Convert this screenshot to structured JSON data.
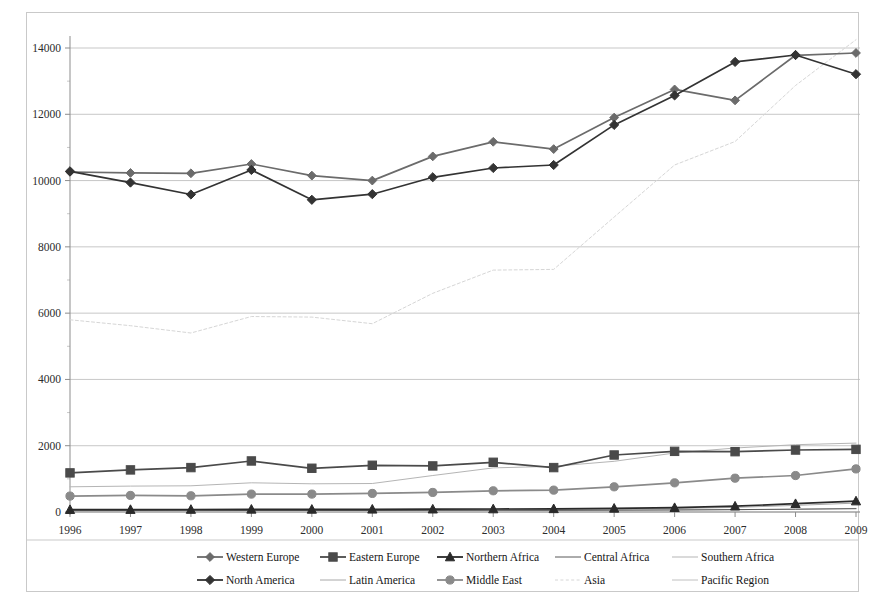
{
  "chart_data": {
    "type": "line",
    "title": "",
    "subtitle": "",
    "xlabel": "",
    "ylabel": "",
    "categories": [
      "1996",
      "1997",
      "1998",
      "1999",
      "2000",
      "2001",
      "2002",
      "2003",
      "2004",
      "2005",
      "2006",
      "2007",
      "2008",
      "2009"
    ],
    "x": [
      1996,
      1997,
      1998,
      1999,
      2000,
      2001,
      2002,
      2003,
      2004,
      2005,
      2006,
      2007,
      2008,
      2009
    ],
    "ylim": [
      0,
      14000
    ],
    "yticks": [
      0,
      2000,
      4000,
      6000,
      8000,
      10000,
      12000,
      14000
    ],
    "ytick_labels": [
      "0",
      "2000",
      "4000",
      "6000",
      "8000",
      "10000",
      "12000",
      "14000"
    ],
    "grid": true,
    "legend_position": "bottom",
    "legend_columns": 5,
    "series": [
      {
        "name": "Western Europe",
        "marker": "diamond",
        "color": "#6b6b6b",
        "values": [
          10260,
          10230,
          10220,
          10500,
          10150,
          10000,
          10730,
          11170,
          10950,
          11900,
          12750,
          12420,
          13780,
          13850
        ]
      },
      {
        "name": "Eastern Europe",
        "marker": "square",
        "color": "#4a4a4a",
        "values": [
          1180,
          1270,
          1340,
          1540,
          1320,
          1410,
          1390,
          1500,
          1340,
          1720,
          1830,
          1820,
          1870,
          1890
        ]
      },
      {
        "name": "Northern Africa",
        "marker": "triangle",
        "color": "#2a2a2a",
        "values": [
          70,
          72,
          75,
          80,
          78,
          82,
          85,
          90,
          95,
          110,
          130,
          175,
          250,
          330
        ]
      },
      {
        "name": "Central Africa",
        "marker": "none",
        "color": "#585858",
        "values": [
          40,
          42,
          43,
          45,
          44,
          46,
          48,
          50,
          52,
          58,
          64,
          72,
          85,
          100
        ]
      },
      {
        "name": "Southern Africa",
        "marker": "none",
        "color": "#b5b5b5",
        "values": [
          760,
          780,
          790,
          880,
          850,
          860,
          1100,
          1330,
          1380,
          1530,
          1780,
          1930,
          2030,
          2080
        ]
      },
      {
        "name": "North America",
        "marker": "filled-diamond",
        "color": "#333333",
        "values": [
          10280,
          9940,
          9580,
          10320,
          9420,
          9590,
          10100,
          10380,
          10470,
          11680,
          12570,
          13580,
          13790,
          13210
        ]
      },
      {
        "name": "Latin America",
        "marker": "none",
        "color": "#a8a8a8",
        "values": [
          55,
          58,
          60,
          64,
          62,
          66,
          70,
          74,
          78,
          90,
          105,
          140,
          200,
          270
        ]
      },
      {
        "name": "Middle East",
        "marker": "circle",
        "color": "#8a8a8a",
        "values": [
          480,
          500,
          490,
          540,
          540,
          560,
          590,
          640,
          660,
          760,
          880,
          1020,
          1100,
          1300
        ]
      },
      {
        "name": "Asia",
        "marker": "none",
        "color": "#d6d6d6",
        "values": [
          5800,
          5620,
          5400,
          5900,
          5880,
          5680,
          6600,
          7300,
          7320,
          8900,
          10470,
          11180,
          12870,
          14250
        ]
      },
      {
        "name": "Pacific Region",
        "marker": "none",
        "color": "#c0c0c0",
        "values": [
          30,
          31,
          32,
          34,
          33,
          35,
          37,
          39,
          41,
          47,
          54,
          66,
          85,
          110
        ]
      }
    ]
  },
  "legend": {
    "rows": [
      [
        "Western Europe",
        "Eastern Europe",
        "Northern Africa",
        "Central Africa",
        "Southern Africa"
      ],
      [
        "North America",
        "Latin America",
        "Middle East",
        "Asia",
        "Pacific Region"
      ]
    ]
  }
}
